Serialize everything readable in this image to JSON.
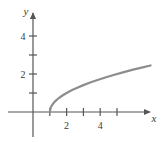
{
  "figure": {
    "name": "square-root-function-graph",
    "background_color": "#ffffff"
  },
  "chart_data": {
    "type": "line",
    "title": "",
    "subtitle": "",
    "xlabel": "x",
    "ylabel": "y",
    "xlim": [
      -1.5,
      7.2
    ],
    "ylim": [
      -1.4,
      5.4
    ],
    "grid": false,
    "legend": null,
    "axis_color": "#555555",
    "curve_color": "#8d8d8d",
    "curve_width": 2.2,
    "x_tick_values": [
      1,
      2,
      3,
      4,
      5
    ],
    "x_tick_labels_shown": [
      "2",
      "4"
    ],
    "x_tick_label_positions": [
      2,
      4
    ],
    "y_tick_values": [
      1,
      2,
      3,
      4
    ],
    "y_tick_labels_shown": [
      "2",
      "4"
    ],
    "y_tick_label_positions": [
      2,
      4
    ],
    "series": [
      {
        "name": "y = sqrt(x - 1)",
        "x": [
          1.0,
          1.05,
          1.1,
          1.2,
          1.3,
          1.45,
          1.6,
          1.8,
          2.0,
          2.3,
          2.6,
          3.0,
          3.4,
          3.8,
          4.3,
          4.8,
          5.3,
          5.9,
          6.4,
          7.0
        ],
        "y": [
          0.0,
          0.224,
          0.316,
          0.447,
          0.548,
          0.671,
          0.775,
          0.894,
          1.0,
          1.14,
          1.265,
          1.414,
          1.549,
          1.673,
          1.817,
          1.949,
          2.074,
          2.214,
          2.324,
          2.449
        ]
      }
    ]
  },
  "annotations": {
    "x_axis_arrow": "arrow-right",
    "y_axis_arrow": "arrow-up",
    "origin_label": ""
  }
}
